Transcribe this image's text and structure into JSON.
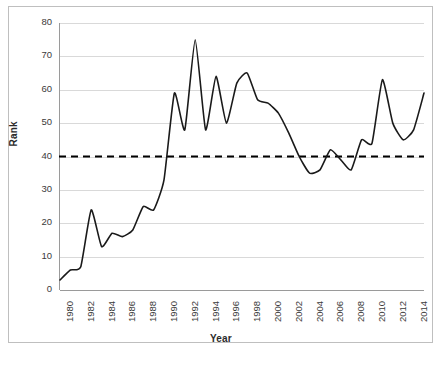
{
  "figure": {
    "background_color": "#ffffff",
    "frame_color": "#bfbfbf"
  },
  "chart_data": {
    "type": "line",
    "title": "",
    "subtitle": "",
    "xlabel": "Year",
    "ylabel": "Rank",
    "xlim": [
      1980,
      2015
    ],
    "ylim": [
      0,
      80
    ],
    "ytick_labels": [
      "0",
      "10",
      "20",
      "30",
      "40",
      "50",
      "60",
      "70",
      "80"
    ],
    "ytick_values": [
      0,
      10,
      20,
      30,
      40,
      50,
      60,
      70,
      80
    ],
    "xtick_labels": [
      "1980",
      "1982",
      "1984",
      "1986",
      "1988",
      "1990",
      "1992",
      "1994",
      "1996",
      "1998",
      "2000",
      "2002",
      "2004",
      "2006",
      "2008",
      "2010",
      "2012",
      "2014"
    ],
    "xtick_values": [
      1980,
      1982,
      1984,
      1986,
      1988,
      1990,
      1992,
      1994,
      1996,
      1998,
      2000,
      2002,
      2004,
      2006,
      2008,
      2010,
      2012,
      2014
    ],
    "grid": "horizontal",
    "grid_color": "#d9d9d9",
    "legend": "none",
    "series": [
      {
        "name": "Rank",
        "style": "solid",
        "color": "#1a1a1a",
        "line_width": 1.6,
        "x": [
          1980,
          1981,
          1982,
          1983,
          1984,
          1985,
          1986,
          1987,
          1988,
          1989,
          1990,
          1991,
          1992,
          1993,
          1994,
          1995,
          1996,
          1997,
          1998,
          1999,
          2000,
          2001,
          2002,
          2003,
          2004,
          2005,
          2006,
          2007,
          2008,
          2009,
          2010,
          2011,
          2012,
          2013,
          2014,
          2015
        ],
        "values": [
          3,
          6,
          7,
          24,
          13,
          17,
          16,
          18,
          25,
          24,
          33,
          59,
          48,
          75,
          48,
          64,
          50,
          62,
          65,
          57,
          56,
          53,
          47,
          40,
          35,
          36,
          42,
          39,
          36,
          45,
          44,
          63,
          50,
          45,
          48,
          59
        ]
      }
    ],
    "annotations": [
      {
        "type": "horizontal-threshold-line",
        "name": "rank-40-threshold",
        "value": 40,
        "style": "dashed",
        "color": "#000000",
        "line_width": 2
      }
    ]
  },
  "caption": {
    "clipped_text": ""
  }
}
